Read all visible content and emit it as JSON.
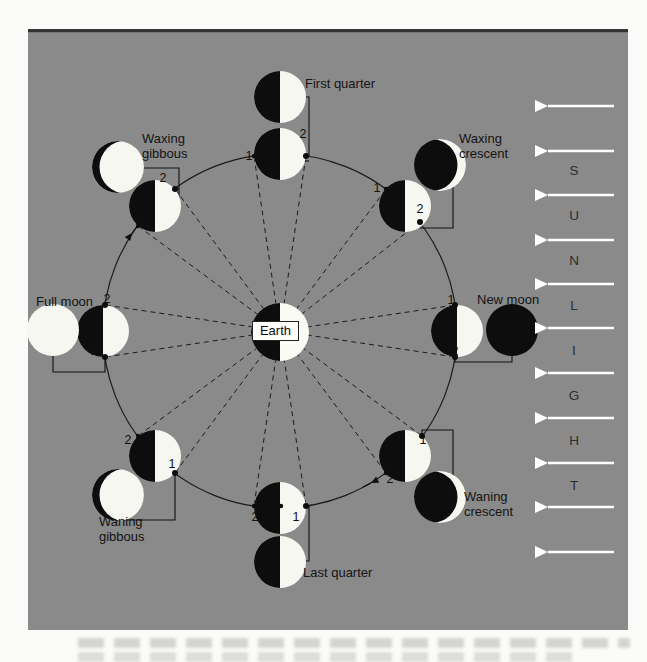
{
  "diagram": {
    "earth": {
      "label": "Earth"
    },
    "phases": [
      {
        "name": "first-quarter",
        "label": "First quarter",
        "n1": "1",
        "n2": "2"
      },
      {
        "name": "waxing-crescent",
        "label": "Waxing crescent",
        "n1": "1",
        "n2": "2"
      },
      {
        "name": "new-moon",
        "label": "New moon",
        "n1": "1",
        "n2": "2"
      },
      {
        "name": "waning-crescent",
        "label": "Waning crescent",
        "n1": "1",
        "n2": "2"
      },
      {
        "name": "last-quarter",
        "label": "Last quarter",
        "n1": "1",
        "n2": "2"
      },
      {
        "name": "waning-gibbous",
        "label": "Waning gibbous",
        "n1": "1",
        "n2": "2"
      },
      {
        "name": "full-moon",
        "label": "Full moon",
        "n1": "1",
        "n2": "2"
      },
      {
        "name": "waxing-gibbous",
        "label": "Waxing gibbous",
        "n1": "1",
        "n2": "2"
      }
    ],
    "sunlight": {
      "letters": [
        "S",
        "U",
        "N",
        "L",
        "I",
        "G",
        "H",
        "T"
      ]
    },
    "colors": {
      "panel_background": "#8a8a8a",
      "moon_light": "#f7f7f2",
      "moon_dark": "#0d0d0d",
      "sun_arrow": "#ffffff",
      "line": "#1b1b1b"
    }
  }
}
